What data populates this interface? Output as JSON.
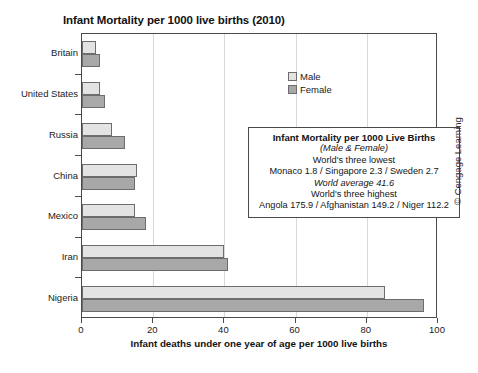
{
  "chart_data": {
    "type": "bar",
    "orientation": "horizontal",
    "title": "Infant Mortality per 1000 live births (2010)",
    "xlabel": "Infant deaths under one year of age per 1000 live births",
    "ylabel": "",
    "xlim": [
      0,
      100
    ],
    "xticks": [
      0,
      20,
      40,
      60,
      80,
      100
    ],
    "grid": true,
    "legend_position": "top-center",
    "categories": [
      "Britain",
      "United States",
      "Russia",
      "China",
      "Mexico",
      "Iran",
      "Nigeria"
    ],
    "series": [
      {
        "name": "Male",
        "color": "#e3e3e3",
        "values": [
          4.0,
          5.0,
          8.5,
          15.5,
          15.0,
          40.0,
          85.0
        ]
      },
      {
        "name": "Female",
        "color": "#a8a8a8",
        "values": [
          5.0,
          6.5,
          12.0,
          15.0,
          18.0,
          41.0,
          96.0
        ]
      }
    ],
    "annotation": {
      "title": "Infant Mortality per 1000 Live Births",
      "subtitle": "(Male & Female)",
      "lowest_header": "World's three lowest",
      "lowest_values": "Monaco 1.8 / Singapore 2.3 / Sweden 2.7",
      "average": "World average 41.6",
      "highest_header": "World's three highest",
      "highest_values": "Angola 175.9 / Afghanistan 149.2 / Niger 112.2"
    }
  },
  "credit": "© Cengage Learning"
}
